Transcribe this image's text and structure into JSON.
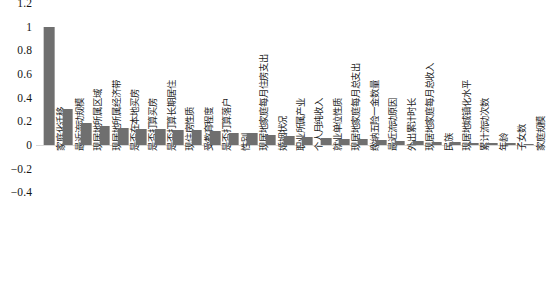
{
  "chart_data": {
    "type": "bar",
    "title": "",
    "xlabel": "",
    "ylabel": "",
    "ylim": [
      -0.4,
      1.2
    ],
    "yticks": [
      1.2,
      1,
      0.8,
      0.6,
      0.4,
      0.2,
      0,
      -0.2,
      -0.4
    ],
    "ytick_labels": [
      "1.2",
      "1",
      "0.8",
      "0.6",
      "0.4",
      "0.2",
      "0",
      "−0.2",
      "−0.4"
    ],
    "grid": false,
    "legend": "none",
    "bar_color": "#6f6f6f",
    "categories": [
      "家庭化迁移",
      "最近流动规模",
      "现居地所属区域",
      "现居地所属经济带",
      "是否在本地买房",
      "是否打算买房",
      "是否打算长期居住",
      "现住房性质",
      "受教育程度",
      "是否打算落户",
      "性别",
      "现居地家庭每月住房支出",
      "婚姻状况",
      "职业所属产业",
      "个人月纯收入",
      "就业单位性质",
      "现居地家庭每月总支出",
      "缴纳五险一金数量",
      "最近流动原因",
      "外出累计时长",
      "现居地家庭每月总收入",
      "民族",
      "现居地城镇化水平",
      "累计流动次数",
      "年龄",
      "子女数",
      "家庭规模"
    ],
    "values": [
      1.0,
      0.305,
      0.187,
      0.163,
      0.142,
      0.136,
      0.131,
      0.127,
      0.124,
      0.115,
      0.104,
      0.098,
      0.088,
      0.075,
      0.068,
      0.06,
      0.053,
      0.047,
      0.041,
      0.036,
      0.031,
      0.027,
      0.023,
      0.02,
      0.017,
      0.014,
      0.012
    ]
  }
}
